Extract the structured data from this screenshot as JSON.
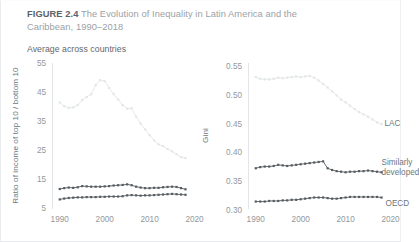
{
  "figure": {
    "number_label": "FIGURE 2.4",
    "title": "The Evolution of Inequality in Latin America and the",
    "title_line2": "Caribbean, 1990–2018",
    "subtitle": "Average across countries"
  },
  "colors": {
    "lac": "#e3e6e8",
    "similarly_developed": "#555b5f",
    "oecd": "#555b5f",
    "axis": "#e3e6e8",
    "tick_text": "#92989c",
    "label_text": "#6e767a",
    "title_text": "#9aa1a6"
  },
  "chart_data": [
    {
      "id": "ratio-panel",
      "type": "line",
      "title": "",
      "xlabel": "",
      "ylabel": "Ratio of income of top 10 / bottom 10",
      "xlim": [
        1988.5,
        2021
      ],
      "ylim": [
        4,
        56.5
      ],
      "xticks": [
        1990,
        2000,
        2010,
        2020
      ],
      "yticks": [
        5,
        15,
        25,
        35,
        45,
        55
      ],
      "grid": false,
      "legend_position": "none",
      "x": [
        1990,
        1991,
        1992,
        1993,
        1994,
        1995,
        1996,
        1997,
        1998,
        1999,
        2000,
        2001,
        2002,
        2003,
        2004,
        2005,
        2006,
        2007,
        2008,
        2009,
        2010,
        2011,
        2012,
        2013,
        2014,
        2015,
        2016,
        2017,
        2018
      ],
      "series": [
        {
          "name": "LAC",
          "color": "#e3e6e8",
          "values": [
            41.5,
            40.2,
            39.6,
            39.8,
            40.6,
            42.3,
            43.4,
            44.3,
            47.5,
            49.2,
            48.9,
            46.5,
            44.4,
            42.5,
            40.6,
            39.3,
            39.5,
            36.6,
            34.2,
            32.2,
            30.2,
            28.4,
            27.0,
            26.4,
            25.4,
            24.6,
            23.6,
            22.6,
            22.3
          ]
        },
        {
          "name": "Similarly developed",
          "color": "#555b5f",
          "values": [
            11.6,
            11.9,
            12.1,
            12.0,
            12.2,
            12.6,
            12.5,
            12.4,
            12.4,
            12.4,
            12.5,
            12.6,
            12.8,
            12.9,
            13.0,
            13.2,
            12.9,
            12.4,
            12.1,
            11.9,
            11.9,
            12.0,
            12.0,
            12.2,
            12.3,
            12.4,
            12.3,
            11.9,
            11.5
          ]
        },
        {
          "name": "OECD",
          "color": "#555b5f",
          "values": [
            8.0,
            8.3,
            8.5,
            8.6,
            8.7,
            8.7,
            8.8,
            8.8,
            8.8,
            8.9,
            8.9,
            9.0,
            9.0,
            9.0,
            9.1,
            9.4,
            9.5,
            9.4,
            9.3,
            9.4,
            9.4,
            9.5,
            9.6,
            9.7,
            9.8,
            9.9,
            9.8,
            9.7,
            9.6
          ]
        }
      ]
    },
    {
      "id": "gini-panel",
      "type": "line",
      "title": "",
      "xlabel": "",
      "ylabel": "Gini",
      "xlim": [
        1988.5,
        2021
      ],
      "ylim": [
        0.2975,
        0.5625
      ],
      "xticks": [
        1990,
        2000,
        2010,
        2020
      ],
      "yticks": [
        0.3,
        0.35,
        0.4,
        0.45,
        0.5,
        0.55
      ],
      "ytick_labels": [
        "0.30",
        "0.35",
        "0.40",
        "0.45",
        "0.50",
        "0.55"
      ],
      "grid": false,
      "legend_position": "inline-right",
      "x": [
        1990,
        1991,
        1992,
        1993,
        1994,
        1995,
        1996,
        1997,
        1998,
        1999,
        2000,
        2001,
        2002,
        2003,
        2004,
        2005,
        2006,
        2007,
        2008,
        2009,
        2010,
        2011,
        2012,
        2013,
        2014,
        2015,
        2016,
        2017,
        2018
      ],
      "series": [
        {
          "name": "LAC",
          "color": "#e3e6e8",
          "label": "LAC",
          "values": [
            0.531,
            0.528,
            0.527,
            0.527,
            0.528,
            0.53,
            0.529,
            0.53,
            0.531,
            0.532,
            0.531,
            0.532,
            0.533,
            0.53,
            0.525,
            0.519,
            0.513,
            0.506,
            0.499,
            0.492,
            0.487,
            0.481,
            0.475,
            0.47,
            0.466,
            0.462,
            0.457,
            0.452,
            0.449
          ]
        },
        {
          "name": "Similarly developed",
          "color": "#555b5f",
          "label": "Similarly\ndeveloped",
          "values": [
            0.372,
            0.374,
            0.375,
            0.375,
            0.376,
            0.378,
            0.377,
            0.376,
            0.377,
            0.378,
            0.379,
            0.38,
            0.381,
            0.382,
            0.383,
            0.384,
            0.372,
            0.369,
            0.367,
            0.366,
            0.365,
            0.366,
            0.366,
            0.367,
            0.367,
            0.368,
            0.367,
            0.366,
            0.365
          ]
        },
        {
          "name": "OECD",
          "color": "#555b5f",
          "label": "OECD",
          "values": [
            0.314,
            0.314,
            0.314,
            0.315,
            0.315,
            0.315,
            0.316,
            0.316,
            0.317,
            0.317,
            0.318,
            0.319,
            0.32,
            0.321,
            0.321,
            0.321,
            0.32,
            0.319,
            0.319,
            0.32,
            0.321,
            0.322,
            0.322,
            0.322,
            0.322,
            0.322,
            0.322,
            0.322,
            0.321
          ]
        }
      ]
    }
  ],
  "series_labels": {
    "lac": "LAC",
    "similarly": "Similarly",
    "developed": "developed",
    "oecd": "OECD"
  }
}
